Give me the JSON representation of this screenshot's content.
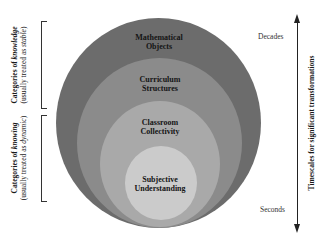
{
  "diagram": {
    "circles": [
      {
        "label": "Mathematical Objects",
        "line1": "Mathematical",
        "line2": "Objects",
        "color": "#6c6c6c"
      },
      {
        "label": "Curriculum Structures",
        "line1": "Curriculum",
        "line2": "Structures",
        "color": "#8b8b8b"
      },
      {
        "label": "Classroom Collectivity",
        "line1": "Classroom",
        "line2": "Collectivity",
        "color": "#a9a9a9"
      },
      {
        "label": "Subjective Understanding",
        "line1": "Subjective",
        "line2": "Understanding",
        "color": "#cbcbcb"
      }
    ],
    "left_brackets": [
      {
        "main_prefix": "Categories of ",
        "main_emph": "knowledge",
        "sub_prefix": "(usually treated as ",
        "sub_emph": "stable",
        "sub_suffix": ")"
      },
      {
        "main_prefix": "Categories of ",
        "main_emph": "knowing",
        "sub_prefix": "(usually treated as ",
        "sub_emph": "dynamic",
        "sub_suffix": ")"
      }
    ],
    "timescale": {
      "axis_label": "Timescales for significant transformations",
      "top_label": "Decades",
      "bottom_label": "Seconds"
    }
  }
}
